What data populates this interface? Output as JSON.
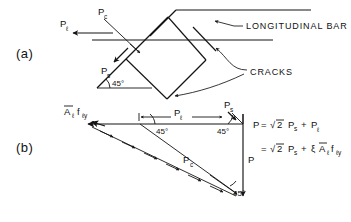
{
  "figure": {
    "parts": [
      {
        "id": "a",
        "label": "(a)"
      },
      {
        "id": "b",
        "label": "(b)"
      }
    ],
    "part_a": {
      "force_longitudinal": "P",
      "force_longitudinal_sub": "ℓ",
      "force_crack": "P",
      "force_crack_sub": "c",
      "force_shear": "P",
      "force_shear_sub": "s",
      "angle": "45°",
      "annotation_bar": "LONGITUDINAL BAR",
      "annotation_cracks": "CRACKS"
    },
    "part_b": {
      "steel_force_main": "A",
      "steel_force_sub1": "ℓ",
      "steel_force_mid": "f",
      "steel_force_sub2": "ℓy",
      "force_longitudinal": "P",
      "force_longitudinal_sub": "ℓ",
      "force_shear": "P",
      "force_shear_sub": "s",
      "force_crack": "P",
      "force_crack_sub": "c",
      "force_resultant": "P",
      "angle_left": "45°",
      "angle_right": "45°",
      "angle_bottom": "45°"
    },
    "equations": {
      "line1": {
        "lhs": "P",
        "eq": "=",
        "radical": "√",
        "radicand": "2",
        "term1_main": "P",
        "term1_sub": "s",
        "plus": "+",
        "term2_main": "P",
        "term2_sub": "ℓ"
      },
      "line2": {
        "eq": "=",
        "radical": "√",
        "radicand": "2",
        "term1_main": "P",
        "term1_sub": "s",
        "plus": "+",
        "xi": "ξ",
        "term2_main": "A",
        "term2_sub1": "ℓ",
        "term2_mid": "f",
        "term2_sub2": "ℓy"
      }
    },
    "colors": {
      "ink": "#141414",
      "background": "#ffffff"
    }
  }
}
